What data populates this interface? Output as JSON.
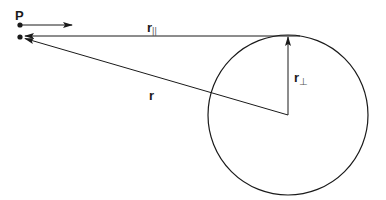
{
  "diagram": {
    "point_label": "P",
    "labels": {
      "r_parallel": {
        "main": "r",
        "subscript": "||"
      },
      "r": {
        "main": "r"
      },
      "r_perp": {
        "main": "r",
        "subscript": "⊥"
      }
    },
    "colors": {
      "stroke": "#1a1a1a",
      "background": "#ffffff"
    },
    "circle": {
      "cx": 288,
      "cy": 115,
      "r": 80
    },
    "points": {
      "p_top": {
        "x": 20,
        "y": 25
      },
      "p_bottom": {
        "x": 20,
        "y": 37
      }
    }
  }
}
